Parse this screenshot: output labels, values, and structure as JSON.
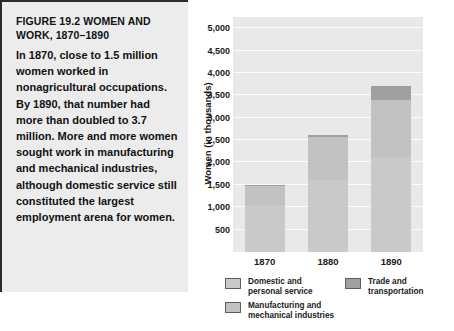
{
  "figure": {
    "title": "FIGURE 19.2  WOMEN AND WORK, 1870–1890",
    "caption": "In 1870, close to 1.5 million women worked in nonagricultural occupations. By 1890, that number had more than doubled to 3.7 million. More and more women sought work in manufacturing and mechanical industries, although domestic service still constituted the largest employment arena for women."
  },
  "chart_data": {
    "type": "bar",
    "stacked": true,
    "title": "FIGURE 19.2  WOMEN AND WORK, 1870–1890",
    "xlabel": "",
    "ylabel": "Women (in thousands)",
    "categories": [
      "1870",
      "1880",
      "1890"
    ],
    "series": [
      {
        "name": "Domestic and\npersonal service",
        "legend_label": "Domestic and\npersonal service",
        "color": "#c9c9c9",
        "values": [
          1050,
          1620,
          2110
        ]
      },
      {
        "name": "Manufacturing and\nmechanical industries",
        "legend_label": "Manufacturing and\nmechanical industries",
        "color": "#c2c2c2",
        "values": [
          430,
          940,
          1290
        ]
      },
      {
        "name": "Trade and\ntransportation",
        "legend_label": "Trade and\ntransportation",
        "color": "#a0a0a0",
        "values": [
          25,
          60,
          320
        ]
      }
    ],
    "totals": [
      1505,
      2620,
      3720
    ],
    "ylim": [
      0,
      5250
    ],
    "yticks": [
      500,
      1000,
      1500,
      2000,
      2500,
      3000,
      3500,
      4000,
      4500,
      5000
    ],
    "ytick_labels": [
      "500",
      "1,000",
      "1,500",
      "2,000",
      "2,500",
      "3,000",
      "3,500",
      "4,000",
      "4,500",
      "5,000"
    ],
    "grid": true,
    "legend_position": "bottom",
    "plot_background": "#e9e9e9",
    "gridline_color": "#fbfbfb"
  }
}
